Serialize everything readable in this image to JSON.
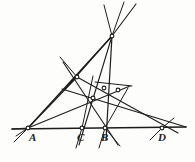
{
  "figure": {
    "kind": "geometry-diagram",
    "background_color": "#fdfdfc",
    "ink_color": "#1c1c1c",
    "width": 195,
    "height": 162
  },
  "labels": [
    {
      "id": "A",
      "text": "A",
      "x": 29,
      "y": 132
    },
    {
      "id": "C",
      "text": "C",
      "x": 77,
      "y": 132
    },
    {
      "id": "B",
      "text": "B",
      "x": 101,
      "y": 132
    },
    {
      "id": "D",
      "text": "D",
      "x": 158,
      "y": 132
    }
  ],
  "points": [
    {
      "id": "A",
      "name": "point-a",
      "x": 28,
      "y": 128,
      "marked": true
    },
    {
      "id": "C",
      "name": "point-c",
      "x": 82,
      "y": 128,
      "marked": true
    },
    {
      "id": "B",
      "name": "point-b",
      "x": 105,
      "y": 128,
      "marked": true
    },
    {
      "id": "D",
      "name": "point-d",
      "x": 162,
      "y": 128,
      "marked": true
    },
    {
      "id": "S",
      "name": "apex-vertex",
      "x": 112,
      "y": 36,
      "marked": true
    },
    {
      "id": "P",
      "name": "left-vertex",
      "x": 77,
      "y": 77,
      "marked": true
    },
    {
      "id": "Q",
      "name": "upper-inner-node",
      "x": 104,
      "y": 88,
      "marked": true
    },
    {
      "id": "R",
      "name": "right-node",
      "x": 118,
      "y": 90,
      "marked": true
    },
    {
      "id": "T",
      "name": "lower-inner-node",
      "x": 93,
      "y": 98,
      "marked": true
    }
  ],
  "segments": [
    {
      "name": "base-line-ad",
      "x1": 12,
      "y1": 129,
      "x2": 186,
      "y2": 127,
      "weight": 1.5
    },
    {
      "name": "base-line-left-tail",
      "x1": 12,
      "y1": 129,
      "x2": 28,
      "y2": 128,
      "weight": 1.2
    },
    {
      "name": "line-a-to-apex",
      "x1": 28,
      "y1": 128,
      "x2": 112,
      "y2": 36,
      "weight": 1.2
    },
    {
      "name": "line-a-to-left-vertex",
      "x1": 28,
      "y1": 128,
      "x2": 77,
      "y2": 77,
      "weight": 1.2
    },
    {
      "name": "line-a-to-right-node",
      "x1": 28,
      "y1": 128,
      "x2": 130,
      "y2": 86,
      "weight": 1.1
    },
    {
      "name": "line-apex-to-left-vertex",
      "x1": 112,
      "y1": 36,
      "x2": 65,
      "y2": 89,
      "weight": 1.2
    },
    {
      "name": "line-apex-to-b",
      "x1": 112,
      "y1": 36,
      "x2": 106,
      "y2": 140,
      "weight": 1.2
    },
    {
      "name": "line-apex-to-c",
      "x1": 112,
      "y1": 36,
      "x2": 79,
      "y2": 145,
      "weight": 1.1
    },
    {
      "name": "line-apex-up-right-1",
      "x1": 112,
      "y1": 36,
      "x2": 136,
      "y2": 4,
      "weight": 1.1
    },
    {
      "name": "line-apex-up-right-2",
      "x1": 112,
      "y1": 36,
      "x2": 124,
      "y2": 2,
      "weight": 1.0
    },
    {
      "name": "line-apex-up-left",
      "x1": 112,
      "y1": 36,
      "x2": 104,
      "y2": 5,
      "weight": 1.0
    },
    {
      "name": "line-left-vertex-to-b",
      "x1": 63,
      "y1": 62,
      "x2": 118,
      "y2": 145,
      "weight": 1.1
    },
    {
      "name": "line-left-vertex-to-d",
      "x1": 62,
      "y1": 89,
      "x2": 186,
      "y2": 127,
      "weight": 1.1
    },
    {
      "name": "line-left-vertex-up-left",
      "x1": 77,
      "y1": 77,
      "x2": 60,
      "y2": 57,
      "weight": 1.0
    },
    {
      "name": "line-through-nodes-to-d",
      "x1": 77,
      "y1": 77,
      "x2": 178,
      "y2": 133,
      "weight": 1.1
    },
    {
      "name": "line-c-upward",
      "x1": 82,
      "y1": 128,
      "x2": 93,
      "y2": 76,
      "weight": 1.0
    },
    {
      "name": "line-c-downward",
      "x1": 82,
      "y1": 128,
      "x2": 76,
      "y2": 148,
      "weight": 1.0
    },
    {
      "name": "line-b-vertical",
      "x1": 105,
      "y1": 128,
      "x2": 99,
      "y2": 148,
      "weight": 1.0
    },
    {
      "name": "line-b-to-upper-right",
      "x1": 105,
      "y1": 128,
      "x2": 128,
      "y2": 88,
      "weight": 1.0
    },
    {
      "name": "chord-right-sweep",
      "x1": 95,
      "y1": 82,
      "x2": 132,
      "y2": 86,
      "weight": 1.0
    },
    {
      "name": "line-a-tail-lower",
      "x1": 28,
      "y1": 128,
      "x2": 14,
      "y2": 142,
      "weight": 1.0
    },
    {
      "name": "line-a-tail-lower-2",
      "x1": 28,
      "y1": 128,
      "x2": 16,
      "y2": 136,
      "weight": 1.0
    },
    {
      "name": "line-d-tail-lower",
      "x1": 162,
      "y1": 128,
      "x2": 150,
      "y2": 140,
      "weight": 1.0
    },
    {
      "name": "line-d-tail-upper",
      "x1": 162,
      "y1": 128,
      "x2": 174,
      "y2": 118,
      "weight": 1.0
    },
    {
      "name": "line-b-tail-lower",
      "x1": 105,
      "y1": 128,
      "x2": 120,
      "y2": 146,
      "weight": 1.0
    }
  ]
}
